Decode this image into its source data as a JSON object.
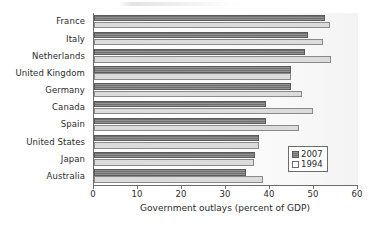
{
  "chart_data": {
    "type": "bar",
    "orientation": "horizontal",
    "title": "",
    "xlabel": "Government outlays (percent of GDP)",
    "ylabel": "",
    "xlim": [
      0,
      60
    ],
    "xticks": [
      0,
      10,
      20,
      30,
      40,
      50,
      60
    ],
    "grid": false,
    "legend_position": "lower right",
    "categories": [
      "France",
      "Italy",
      "Netherlands",
      "United Kingdom",
      "Germany",
      "Canada",
      "Spain",
      "United States",
      "Japan",
      "Australia"
    ],
    "series": [
      {
        "name": "2007",
        "color": "#7b7b7b",
        "values": [
          52.5,
          48.6,
          48.0,
          44.8,
          44.8,
          39.0,
          39.0,
          37.5,
          36.6,
          34.5
        ]
      },
      {
        "name": "1994",
        "color": "#dcdcdc",
        "values": [
          53.6,
          52.0,
          53.8,
          44.8,
          47.2,
          49.8,
          46.6,
          37.5,
          36.4,
          38.4
        ]
      }
    ]
  },
  "legend": {
    "entries": [
      {
        "label": "2007",
        "swatch": "dark-hatched-swatch"
      },
      {
        "label": "1994",
        "swatch": "light-open-swatch"
      }
    ]
  },
  "axis": {
    "x_title": "Government outlays (percent of GDP)",
    "tick_labels": [
      "0",
      "10",
      "20",
      "30",
      "40",
      "50",
      "60"
    ]
  }
}
